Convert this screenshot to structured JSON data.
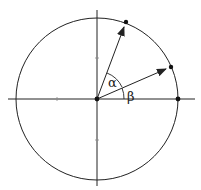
{
  "diagram": {
    "type": "unit-circle-angles",
    "colors": {
      "stroke": "#222222",
      "background": "#ffffff"
    },
    "center": [
      97,
      99
    ],
    "radius": 81,
    "axes": {
      "horizontal": {
        "from": [
          8,
          99
        ],
        "to": [
          195,
          99
        ]
      },
      "vertical": {
        "from": [
          97,
          10
        ],
        "to": [
          97,
          186
        ]
      }
    },
    "ticks": [
      [
        57,
        99
      ],
      [
        97,
        58
      ],
      [
        97,
        140
      ]
    ],
    "points": [
      {
        "name": "origin",
        "pos": [
          97,
          99
        ]
      },
      {
        "name": "x-intercept",
        "pos": [
          178,
          99
        ]
      },
      {
        "name": "alpha-tip",
        "pos": [
          126,
          22
        ]
      },
      {
        "name": "beta-tip",
        "pos": [
          171,
          67
        ]
      }
    ],
    "vectors": [
      {
        "name": "alpha-vector",
        "to": [
          126,
          22
        ]
      },
      {
        "name": "beta-vector",
        "to": [
          171,
          67
        ]
      }
    ],
    "angles": [
      {
        "name": "alpha",
        "label": "α",
        "label_pos": [
          109,
          87
        ]
      },
      {
        "name": "beta",
        "label": "β",
        "label_pos": [
          127,
          101
        ]
      }
    ]
  }
}
